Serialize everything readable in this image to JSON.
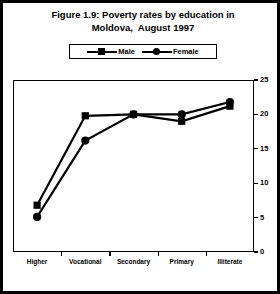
{
  "figure": {
    "title_line_1": "Figure 1.9: Poverty rates by education in",
    "title_line_2": "Moldova,  August 1997"
  },
  "legend": {
    "entries": [
      {
        "label": "Male",
        "marker": "square"
      },
      {
        "label": "Female",
        "marker": "circle"
      }
    ]
  },
  "axis": {
    "y_ticks": [
      "0",
      "5",
      "10",
      "15",
      "20",
      "25"
    ],
    "x_ticks": [
      "Higher",
      "Vocational",
      "Secondary",
      "Primary",
      "Illiterate"
    ]
  },
  "chart_data": {
    "type": "line",
    "title": "Figure 1.9: Poverty rates by education in Moldova,  August 1997",
    "xlabel": "",
    "ylabel": "",
    "categories": [
      "Higher",
      "Vocational",
      "Secondary",
      "Primary",
      "Illiterate"
    ],
    "series": [
      {
        "name": "Male",
        "marker": "square",
        "values": [
          6.8,
          19.8,
          20.0,
          19.0,
          21.2
        ]
      },
      {
        "name": "Female",
        "marker": "circle",
        "values": [
          5.1,
          16.2,
          20.0,
          20.0,
          21.8
        ]
      }
    ],
    "ylim": [
      0,
      25
    ],
    "ytick_step": 5,
    "y_axis_position": "right",
    "grid": false,
    "legend_position": "top-center",
    "line_color": "#000000"
  }
}
